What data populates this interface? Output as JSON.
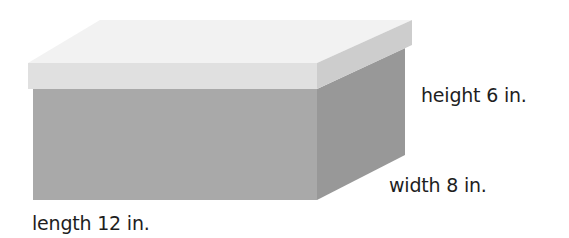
{
  "diagram": {
    "type": "rectangular-prism",
    "labels": {
      "height": "height 6 in.",
      "width": "width 8 in.",
      "length": "length 12 in."
    },
    "dimensions": {
      "length": {
        "value": 12,
        "unit": "in."
      },
      "width": {
        "value": 8,
        "unit": "in."
      },
      "height": {
        "value": 6,
        "unit": "in."
      }
    },
    "colors": {
      "lid_top": "#f2f2f2",
      "lid_front": "#e0e0e0",
      "lid_side": "#cdcdcd",
      "body_front": "#a9a9a9",
      "body_side": "#989898",
      "label_text": "#1e1e1e"
    }
  }
}
